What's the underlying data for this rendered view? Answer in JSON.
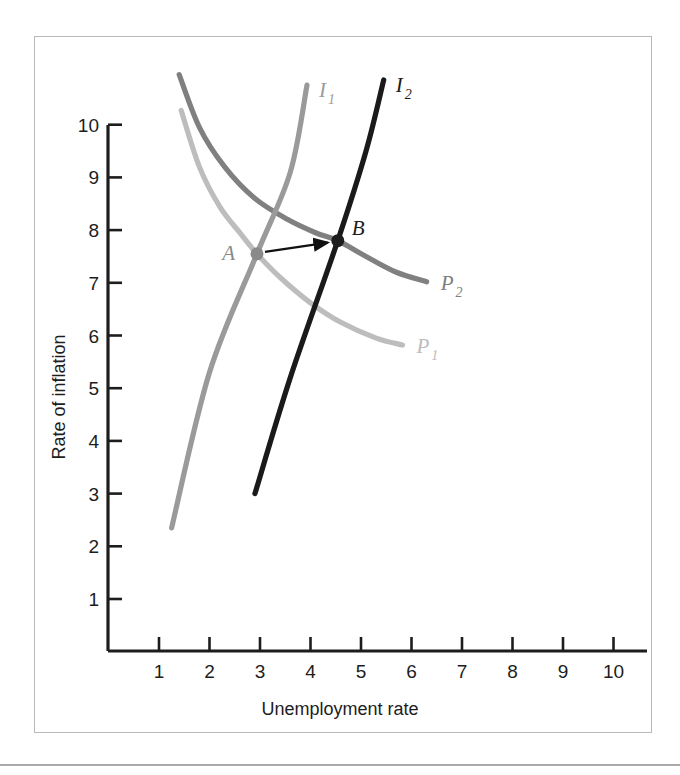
{
  "chart_data": {
    "type": "line",
    "title": "",
    "xlabel": "Unemployment rate",
    "ylabel": "Rate of inflation",
    "xlim": [
      0,
      10.6
    ],
    "ylim": [
      0,
      10.6
    ],
    "xticks": [
      "1",
      "2",
      "3",
      "4",
      "5",
      "6",
      "7",
      "8",
      "9",
      "10"
    ],
    "yticks": [
      "1",
      "2",
      "3",
      "4",
      "5",
      "6",
      "7",
      "8",
      "9",
      "10"
    ],
    "grid": false,
    "legend": "inline-labels",
    "series": [
      {
        "name": "P_1",
        "label_main": "P",
        "label_sub": "1",
        "role": "short-run-phillips-curve-initial",
        "color": "#bdbdbd",
        "points": [
          [
            1.44,
            10.27
          ],
          [
            1.8,
            9.2
          ],
          [
            2.2,
            8.45
          ],
          [
            2.6,
            7.95
          ],
          [
            2.94,
            7.55
          ],
          [
            3.4,
            7.1
          ],
          [
            4.0,
            6.62
          ],
          [
            4.6,
            6.25
          ],
          [
            5.3,
            5.95
          ],
          [
            5.82,
            5.82
          ]
        ]
      },
      {
        "name": "P_2",
        "label_main": "P",
        "label_sub": "2",
        "role": "short-run-phillips-curve-shifted",
        "color": "#808080",
        "points": [
          [
            1.4,
            10.95
          ],
          [
            1.8,
            9.95
          ],
          [
            2.3,
            9.2
          ],
          [
            2.9,
            8.6
          ],
          [
            3.55,
            8.2
          ],
          [
            4.1,
            7.95
          ],
          [
            4.54,
            7.8
          ],
          [
            5.1,
            7.5
          ],
          [
            5.7,
            7.2
          ],
          [
            6.3,
            7.02
          ]
        ]
      },
      {
        "name": "I_1",
        "label_main": "I",
        "label_sub": "1",
        "role": "aggregate-demand-inflation-initial",
        "color": "#9a9a9a",
        "points": [
          [
            1.25,
            2.35
          ],
          [
            2.0,
            5.3
          ],
          [
            2.94,
            7.55
          ],
          [
            3.6,
            9.1
          ],
          [
            3.93,
            10.75
          ]
        ]
      },
      {
        "name": "I_2",
        "label_main": "I",
        "label_sub": "2",
        "role": "aggregate-demand-inflation-shifted",
        "color": "#1a1a1a",
        "points": [
          [
            2.9,
            3.0
          ],
          [
            3.6,
            5.2
          ],
          [
            4.54,
            7.8
          ],
          [
            5.1,
            9.5
          ],
          [
            5.45,
            10.85
          ]
        ]
      }
    ],
    "points": [
      {
        "label": "A",
        "x": 2.94,
        "y": 7.55,
        "color": "#8a8a8a",
        "label_offset_x": -22,
        "label_offset_y": 6
      },
      {
        "label": "B",
        "x": 4.54,
        "y": 7.8,
        "color": "#1d1d1d",
        "label_offset_x": 14,
        "label_offset_y": -6
      }
    ],
    "annotations": [
      {
        "type": "arrow",
        "name": "shift-arrow-a-to-b",
        "from_x": 2.94,
        "from_y": 7.55,
        "to_x": 4.54,
        "to_y": 7.8,
        "color": "#111111"
      }
    ]
  }
}
